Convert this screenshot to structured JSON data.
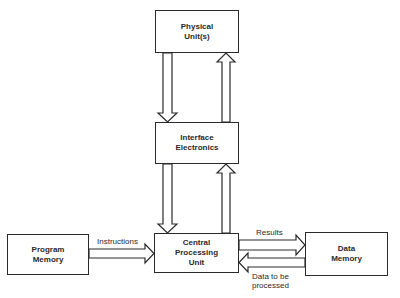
{
  "diagram": {
    "nodes": {
      "physical_units": {
        "line1": "Physical",
        "line2": "Unit(s)"
      },
      "interface_electronics": {
        "line1": "Interface",
        "line2": "Electronics"
      },
      "cpu": {
        "line1": "Central",
        "line2": "Processing",
        "line3": "Unit"
      },
      "program_memory": {
        "line1": "Program",
        "line2": "Memory"
      },
      "data_memory": {
        "line1": "Data",
        "line2": "Memory"
      }
    },
    "edge_labels": {
      "instructions": "Instructions",
      "results": "Results",
      "data_to_be_processed_1": "Data to be",
      "data_to_be_processed_2": "processed"
    },
    "edges": [
      {
        "from": "physical_units",
        "to": "interface_electronics"
      },
      {
        "from": "interface_electronics",
        "to": "physical_units"
      },
      {
        "from": "interface_electronics",
        "to": "cpu"
      },
      {
        "from": "cpu",
        "to": "interface_electronics"
      },
      {
        "from": "program_memory",
        "to": "cpu",
        "label": "Instructions"
      },
      {
        "from": "cpu",
        "to": "data_memory",
        "label": "Results"
      },
      {
        "from": "data_memory",
        "to": "cpu",
        "label": "Data to be processed"
      }
    ]
  }
}
